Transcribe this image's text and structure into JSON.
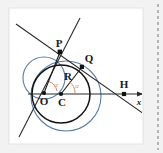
{
  "figure": {
    "name": "circle-tangent-geometry-figure",
    "card_background": "#ffffff",
    "page_background": "#f2f2f2",
    "right_edge_dashes": "dashed-vertical-rule"
  },
  "colors": {
    "main_circle": "#1a1a1a",
    "construction_circle": "#5b7fa6",
    "line": "#2b2b2b",
    "angle_arc": "#d98b6e",
    "angle_text": "#d98b6e",
    "point_fill": "#111111",
    "label_text": "#1a1a1a",
    "card_border": "#d8d8d8",
    "dash_color": "#8c8c8c"
  },
  "labels": {
    "point_P": "P",
    "point_Q": "Q",
    "point_O": "O",
    "point_C": "C",
    "point_H": "H",
    "radius_R": "R",
    "angle_left": "α",
    "angle_right": "α",
    "axis_x": "x"
  },
  "geometry": {
    "main_circle": {
      "cx": 61,
      "cy": 94,
      "r": 29
    },
    "construction_circle_large": {
      "cx": 66,
      "cy": 96,
      "r": 35
    },
    "construction_circle_small": {
      "cx": 44,
      "cy": 78,
      "r": 21
    },
    "points": {
      "P": {
        "x": 60,
        "y": 52
      },
      "Q": {
        "x": 82,
        "y": 67
      },
      "O": {
        "x": 44,
        "y": 93
      },
      "C": {
        "x": 61,
        "y": 94
      },
      "H": {
        "x": 124,
        "y": 94
      }
    },
    "axis": {
      "x1": 30,
      "y1": 94,
      "x2": 143,
      "y2": 94
    },
    "secant_line": {
      "x1": 18,
      "y1": 26,
      "x2": 142,
      "y2": 113
    },
    "through_line": {
      "x1": 78,
      "y1": 20,
      "x2": 20,
      "y2": 133
    },
    "segments": [
      {
        "name": "C-to-Q",
        "from": "C",
        "to": "Q"
      },
      {
        "name": "O-to-P",
        "from": "O",
        "to": "P"
      }
    ]
  }
}
